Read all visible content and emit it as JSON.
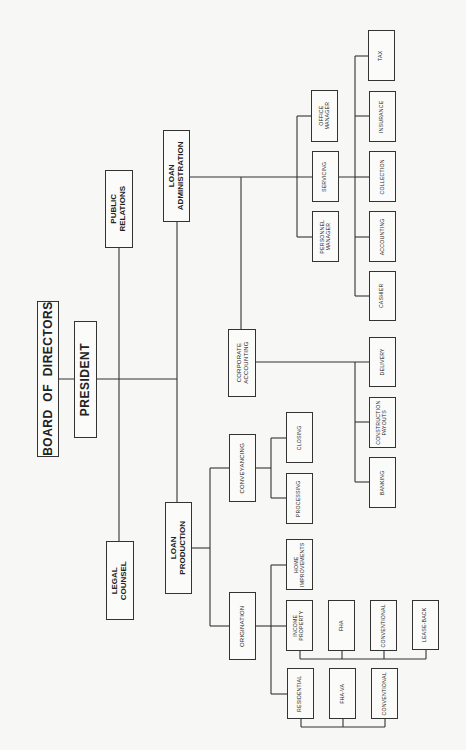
{
  "chart": {
    "orientation": "rotated-90",
    "nodes": {
      "board": "BOARD  OF  DIRECTORS",
      "president": "PRESIDENT",
      "legal": "LEGAL\nCOUNSEL",
      "public": "PUBLIC\nRELATIONS",
      "loan_admin": "LOAN\nADMINISTRATION",
      "loan_prod": "LOAN\nPRODUCTION",
      "corp_acct": "CORPORATE\nACCOUNTING",
      "conveyancing": "CONVEYANCING",
      "origination": "ORIGINATION",
      "office_mgr": "OFFICE\nMANAGER",
      "servicing": "SERVICING",
      "personnel_mgr": "PERSONNEL\nMANAGER",
      "tax": "TAX",
      "insurance": "INSURANCE",
      "collection": "COLLECTION",
      "accounting": "ACCOUNTING",
      "cashier": "CASHIER",
      "delivery": "DELIVERY",
      "construction": "CONSTRUCTION\nPAYOUTS",
      "banking": "BANKING",
      "closing": "CLOSING",
      "processing": "PROCESSING",
      "home_impr": "HOME\nIMPROVEMENTS",
      "income_prop": "INCOME\nPROPERTY",
      "fha": "FHA",
      "conventional1": "CONVENTIONAL",
      "lease_back": "LEASE-BACK",
      "residential": "RESIDENTIAL",
      "fha_va": "FHA-VA",
      "conventional2": "CONVENTIONAL"
    }
  }
}
